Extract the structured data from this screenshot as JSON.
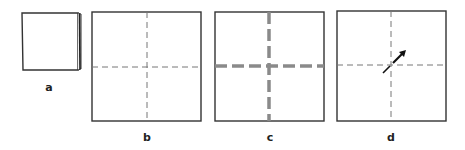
{
  "figure": {
    "panels": [
      {
        "id": "a",
        "label": "a",
        "description": "square folded in half, showing layered right edge"
      },
      {
        "id": "b",
        "label": "b",
        "description": "unfolded square with thin dashed center crease lines"
      },
      {
        "id": "c",
        "label": "c",
        "description": "square with thick gray dashed center lines"
      },
      {
        "id": "d",
        "label": "d",
        "description": "square with dashed crease lines and diagonal arrow at center"
      }
    ],
    "colors": {
      "outline": "#333333",
      "thin_dash": "#777777",
      "thick_dash": "#8a8a8a",
      "arrow": "#111111",
      "label": "#222222"
    }
  }
}
